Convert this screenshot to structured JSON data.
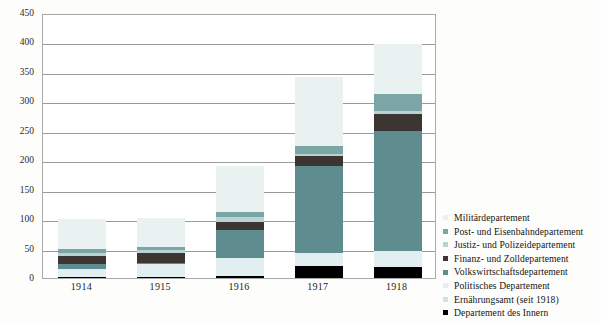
{
  "chart_data": {
    "type": "bar",
    "stacked": true,
    "title": "",
    "xlabel": "",
    "ylabel": "",
    "categories": [
      "1914",
      "1915",
      "1916",
      "1917",
      "1918"
    ],
    "ylim": [
      0,
      450
    ],
    "yticks": [
      0,
      50,
      100,
      150,
      200,
      250,
      300,
      350,
      400,
      450
    ],
    "grid": true,
    "legend_position": "right",
    "series": [
      {
        "name": "Departement des Innern",
        "color": "#000000",
        "values": [
          2,
          2,
          4,
          20,
          18
        ]
      },
      {
        "name": "Ernährungsamt (seit 1918)",
        "color": "#cfe2e4",
        "values": [
          0,
          0,
          0,
          0,
          0
        ]
      },
      {
        "name": "Politisches Departement",
        "color": "#e2eff0",
        "values": [
          13,
          22,
          30,
          22,
          28
        ]
      },
      {
        "name": "Volkswirtschaftsdepartement",
        "color": "#5f8d8f",
        "values": [
          8,
          2,
          48,
          148,
          203
        ]
      },
      {
        "name": "Finanz- und Zolldepartement",
        "color": "#3c3532",
        "values": [
          15,
          16,
          13,
          17,
          29
        ]
      },
      {
        "name": "Justiz- und Polizeidepartement",
        "color": "#b9d3d4",
        "values": [
          5,
          5,
          9,
          4,
          5
        ]
      },
      {
        "name": "Post- und Eisenbahndepartement",
        "color": "#7ca5a6",
        "values": [
          7,
          6,
          9,
          14,
          30
        ]
      },
      {
        "name": "Militärdepartement",
        "color": "#e9f1f1",
        "values": [
          50,
          49,
          77,
          117,
          84
        ]
      }
    ],
    "totals": [
      100,
      100,
      190,
      342,
      397
    ]
  },
  "legend": {
    "entries": [
      {
        "label": "Militärdepartement",
        "color": "#e9f1f1"
      },
      {
        "label": "Post- und Eisenbahndepartement",
        "color": "#7ca5a6"
      },
      {
        "label": "Justiz- und Polizeidepartement",
        "color": "#b9d3d4"
      },
      {
        "label": "Finanz- und Zolldepartement",
        "color": "#3c3532"
      },
      {
        "label": "Volkswirtschaftsdepartement",
        "color": "#5f8d8f"
      },
      {
        "label": "Politisches Departement",
        "color": "#e2eff0"
      },
      {
        "label": "Ernährungsamt (seit 1918)",
        "color": "#cfe2e4"
      },
      {
        "label": "Departement des Innern",
        "color": "#000000"
      }
    ]
  }
}
